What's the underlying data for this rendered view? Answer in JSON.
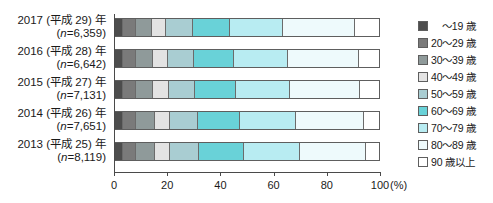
{
  "chart_data": {
    "type": "bar",
    "orientation": "horizontal",
    "stacked": true,
    "normalized_percent": true,
    "title": "",
    "xlabel": "(%)",
    "ylabel": "",
    "xlim": [
      0,
      100
    ],
    "xticks": [
      0,
      20,
      40,
      60,
      80,
      100
    ],
    "xtick_labels": [
      "0",
      "20",
      "40",
      "60",
      "80",
      "100"
    ],
    "unit": "(%)",
    "grid": false,
    "legend_position": "right",
    "categories": [
      "2017 (平成 29) 年 (n=6,359)",
      "2016 (平成 28) 年 (n=6,642)",
      "2015 (平成 27) 年 (n=7,131)",
      "2014 (平成 26) 年 (n=7,651)",
      "2013 (平成 25) 年 (n=8,119)"
    ],
    "series": [
      {
        "name": "～19 歳",
        "color": "#4d4d4d",
        "values": [
          3.0,
          3.0,
          3.0,
          3.0,
          3.0
        ]
      },
      {
        "name": "20～29 歳",
        "color": "#7a7a7a",
        "values": [
          5.0,
          5.0,
          5.0,
          5.0,
          5.0
        ]
      },
      {
        "name": "30～39 歳",
        "color": "#8f9a9a",
        "values": [
          6.0,
          6.5,
          6.5,
          7.0,
          7.0
        ]
      },
      {
        "name": "40～49 歳",
        "color": "#e3e3e3",
        "values": [
          5.5,
          5.5,
          6.0,
          6.0,
          6.0
        ]
      },
      {
        "name": "50～59 歳",
        "color": "#a9cdd2",
        "values": [
          10.0,
          10.0,
          10.0,
          10.5,
          11.0
        ]
      },
      {
        "name": "60～69 歳",
        "color": "#69d2d8",
        "values": [
          14.0,
          15.0,
          15.5,
          16.0,
          17.0
        ]
      },
      {
        "name": "70～79 歳",
        "color": "#b8ecf2",
        "values": [
          20.0,
          20.5,
          20.5,
          21.0,
          21.0
        ]
      },
      {
        "name": "80～89 歳",
        "color": "#eefafc",
        "values": [
          27.5,
          27.0,
          26.5,
          26.0,
          25.0
        ]
      },
      {
        "name": "90 歳以上",
        "color": "#ffffff",
        "values": [
          9.0,
          7.5,
          7.0,
          5.5,
          5.0
        ]
      }
    ]
  },
  "axis": {
    "tick_labels": [
      "0",
      "20",
      "40",
      "60",
      "80",
      "100"
    ],
    "unit": "(%)"
  },
  "rows": [
    {
      "line1": "2017 (平成 29) 年",
      "line2_pre": "(",
      "line2_n": "n",
      "line2_post": "=6,359)"
    },
    {
      "line1": "2016 (平成 28) 年",
      "line2_pre": "(",
      "line2_n": "n",
      "line2_post": "=6,642)"
    },
    {
      "line1": "2015 (平成 27) 年",
      "line2_pre": "(",
      "line2_n": "n",
      "line2_post": "=7,131)"
    },
    {
      "line1": "2014 (平成 26) 年",
      "line2_pre": "(",
      "line2_n": "n",
      "line2_post": "=7,651)"
    },
    {
      "line1": "2013 (平成 25) 年",
      "line2_pre": "(",
      "line2_n": "n",
      "line2_post": "=8,119)"
    }
  ],
  "legend": {
    "items": [
      {
        "label": "～19 歳",
        "color": "#4d4d4d"
      },
      {
        "label": "20～29 歳",
        "color": "#7a7a7a"
      },
      {
        "label": "30～39 歳",
        "color": "#8f9a9a"
      },
      {
        "label": "40～49 歳",
        "color": "#e3e3e3"
      },
      {
        "label": "50～59 歳",
        "color": "#a9cdd2"
      },
      {
        "label": "60～69 歳",
        "color": "#69d2d8"
      },
      {
        "label": "70～79 歳",
        "color": "#b8ecf2"
      },
      {
        "label": "80～89 歳",
        "color": "#eefafc"
      },
      {
        "label": "90 歳以上",
        "color": "#ffffff"
      }
    ]
  }
}
